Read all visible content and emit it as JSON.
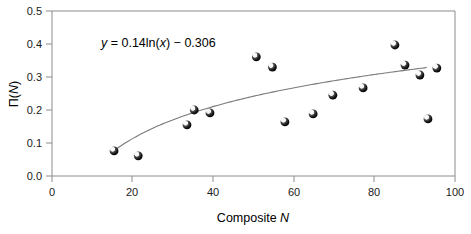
{
  "chart_data": {
    "type": "scatter",
    "title": "",
    "xlabel": "Composite N",
    "ylabel": "Π(N)",
    "xlim": [
      0,
      100
    ],
    "ylim": [
      0.0,
      0.5
    ],
    "xticks": [
      "0",
      "20",
      "40",
      "60",
      "80",
      "100"
    ],
    "xtick_values": [
      0,
      20,
      40,
      60,
      80,
      100
    ],
    "yticks": [
      "0.0",
      "0.1",
      "0.2",
      "0.3",
      "0.4",
      "0.5"
    ],
    "ytick_values": [
      0.0,
      0.1,
      0.2,
      0.3,
      0.4,
      0.5
    ],
    "grid": false,
    "legend": null,
    "annotation": "y = 0.14ln(x) − 0.306",
    "annotation_parts": {
      "y": "y",
      "rest": " = 0.14ln(",
      "x": "x",
      "tail": ") − 0.306"
    },
    "trendline": {
      "type": "logarithmic",
      "a": 0.14,
      "b": -0.306,
      "equation": "y = 0.14ln(x) − 0.306",
      "x_start": 15,
      "x_end": 93
    },
    "marker_style": "3d-sphere",
    "marker_color": "#1a1a1a",
    "points": [
      {
        "x": 15.4,
        "y": 0.076
      },
      {
        "x": 21.4,
        "y": 0.061
      },
      {
        "x": 33.5,
        "y": 0.155
      },
      {
        "x": 35.3,
        "y": 0.2
      },
      {
        "x": 39.2,
        "y": 0.191
      },
      {
        "x": 50.7,
        "y": 0.361
      },
      {
        "x": 54.7,
        "y": 0.33
      },
      {
        "x": 57.8,
        "y": 0.164
      },
      {
        "x": 64.8,
        "y": 0.188
      },
      {
        "x": 69.7,
        "y": 0.245
      },
      {
        "x": 77.2,
        "y": 0.267
      },
      {
        "x": 85.1,
        "y": 0.397
      },
      {
        "x": 87.6,
        "y": 0.336
      },
      {
        "x": 91.3,
        "y": 0.306
      },
      {
        "x": 93.3,
        "y": 0.173
      },
      {
        "x": 95.5,
        "y": 0.327
      }
    ],
    "axis_color": "#8c8c8c",
    "trend_color": "#7a7a7a"
  },
  "xlabel_parts": {
    "prefix": "Composite ",
    "italic": "N"
  },
  "ylabel_parts": {
    "prefix": "Π(",
    "italic": "N",
    "suffix": ")"
  }
}
